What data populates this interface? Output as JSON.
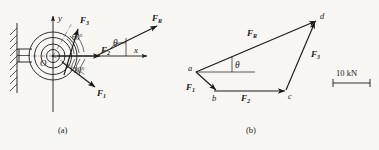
{
  "figure": {
    "background_color": "#f7f6f3",
    "ink_color": "#1a1a1a",
    "panels": [
      {
        "caption": "(a)",
        "kind": "free-body-diagram"
      },
      {
        "caption": "(b)",
        "kind": "force-polygon"
      }
    ]
  },
  "panel_a": {
    "caption": "(a)",
    "origin_label": "O",
    "axis_x_label": "x",
    "axis_y_label": "y",
    "forces": [
      {
        "name": "F1",
        "label": "F",
        "subscript": "1",
        "direction": "down-right",
        "angle_from_x_deg": -30
      },
      {
        "name": "F2",
        "label": "F",
        "subscript": "2",
        "direction": "right",
        "angle_from_x_deg": 0
      },
      {
        "name": "F3",
        "label": "F",
        "subscript": "3",
        "direction": "up-right",
        "angle_from_x_deg": 60
      },
      {
        "name": "FR",
        "label": "F",
        "subscript": "R",
        "direction": "up-right",
        "angle_from_x_deg": 20
      }
    ],
    "angles": [
      {
        "label": "60°",
        "between": "F3 and F2"
      },
      {
        "label": "30°",
        "between": "F2 and F1"
      },
      {
        "label": "θ",
        "between": "FR and x-axis"
      }
    ],
    "support": {
      "type": "wall-bracket",
      "hatched": true
    }
  },
  "panel_b": {
    "caption": "(b)",
    "vertices": [
      "a",
      "b",
      "c",
      "d"
    ],
    "edges": [
      {
        "from": "a",
        "to": "b",
        "label": "F",
        "subscript": "1"
      },
      {
        "from": "b",
        "to": "c",
        "label": "F",
        "subscript": "2"
      },
      {
        "from": "c",
        "to": "d",
        "label": "F",
        "subscript": "3"
      },
      {
        "from": "a",
        "to": "d",
        "label": "F",
        "subscript": "R"
      }
    ],
    "angle_label": "θ",
    "scale_bar": {
      "label": "10 kN",
      "value": 10,
      "unit": "kN"
    }
  }
}
